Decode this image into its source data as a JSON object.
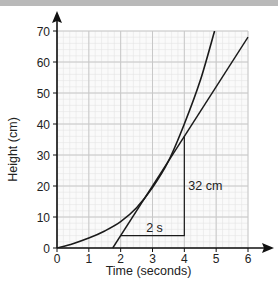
{
  "chart_data": {
    "type": "line",
    "title": "",
    "xlabel": "Time (seconds)",
    "ylabel": "Height (cm)",
    "xlim": [
      0,
      6
    ],
    "ylim": [
      0,
      70
    ],
    "x_ticks": [
      "0",
      "1",
      "2",
      "3",
      "4",
      "5",
      "6"
    ],
    "y_ticks": [
      "0",
      "10",
      "20",
      "30",
      "40",
      "50",
      "60",
      "70"
    ],
    "grid": true,
    "series": [
      {
        "name": "curve",
        "x": [
          0,
          0.5,
          1,
          1.5,
          2,
          2.5,
          3,
          3.5,
          4,
          4.5,
          4.95
        ],
        "y": [
          0,
          1.4,
          3.2,
          5.5,
          8.5,
          13,
          19.5,
          28,
          40,
          54,
          70
        ]
      },
      {
        "name": "tangent",
        "x": [
          1.75,
          6
        ],
        "y": [
          0,
          68
        ]
      }
    ],
    "annotations": [
      {
        "type": "gradient-triangle",
        "from": [
          2,
          4
        ],
        "corner": [
          4,
          4
        ],
        "to": [
          4,
          36
        ]
      },
      {
        "text": "2 s",
        "position": "horizontal-leg"
      },
      {
        "text": "32 cm",
        "position": "vertical-leg"
      }
    ]
  },
  "labels": {
    "x_axis": "Time (seconds)",
    "y_axis": "Height (cm)",
    "run": "2 s",
    "rise": "32 cm"
  },
  "colors": {
    "grid_major": "#c8c8c8",
    "grid_minor": "#e4e4e4",
    "line": "#1a1a1a",
    "top_bar": "#b9b9b9"
  }
}
